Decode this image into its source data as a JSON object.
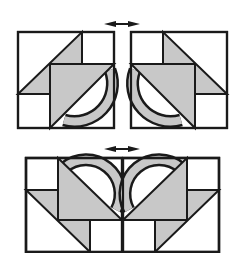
{
  "diagram": {
    "colors": {
      "fill_gray": "#c8c8c8",
      "stroke": "#1a1a1a",
      "background": "#ffffff"
    },
    "top_arrow": {
      "label": "mirror-arrow-top"
    },
    "bottom_arrow": {
      "label": "mirror-arrow-bottom"
    },
    "blocks": [
      "block-left",
      "block-right",
      "joined-blocks"
    ]
  }
}
